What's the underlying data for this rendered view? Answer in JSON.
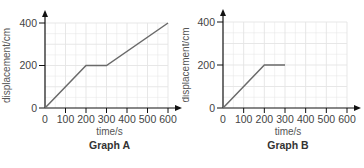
{
  "chart_data": [
    {
      "type": "line",
      "title": "Graph A",
      "xlabel": "time/s",
      "ylabel": "displacement/cm",
      "x_ticks": [
        0,
        100,
        200,
        300,
        400,
        500,
        600
      ],
      "y_ticks": [
        0,
        200,
        400
      ],
      "xlim": [
        0,
        600
      ],
      "ylim": [
        0,
        400
      ],
      "grid": true,
      "series": [
        {
          "name": "displacement",
          "x": [
            0,
            200,
            300,
            600
          ],
          "y": [
            0,
            200,
            200,
            400
          ],
          "color": "#666666"
        }
      ]
    },
    {
      "type": "line",
      "title": "Graph B",
      "xlabel": "time/s",
      "ylabel": "displacement/cm",
      "x_ticks": [
        0,
        100,
        200,
        300,
        400,
        500,
        600
      ],
      "y_ticks": [
        0,
        200,
        400
      ],
      "xlim": [
        0,
        600
      ],
      "ylim": [
        0,
        400
      ],
      "grid": true,
      "series": [
        {
          "name": "displacement",
          "x": [
            0,
            200,
            300
          ],
          "y": [
            0,
            200,
            200
          ],
          "color": "#666666"
        }
      ]
    }
  ],
  "labels": {
    "graph_a": {
      "title": "Graph A",
      "xlabel": "time/s",
      "ylabel": "displacement/cm",
      "x_ticks": [
        "0",
        "100",
        "200",
        "300",
        "400",
        "500",
        "600"
      ],
      "y_ticks": [
        "0",
        "200",
        "400"
      ]
    },
    "graph_b": {
      "title": "Graph B",
      "xlabel": "time/s",
      "ylabel": "displacement/cm",
      "x_ticks": [
        "0",
        "100",
        "200",
        "300",
        "400",
        "500",
        "600"
      ],
      "y_ticks": [
        "0",
        "200",
        "400"
      ]
    }
  },
  "colors": {
    "axis": "#111111",
    "line": "#6a6a6a",
    "grid": "#e4e4e4",
    "text": "#444444"
  }
}
